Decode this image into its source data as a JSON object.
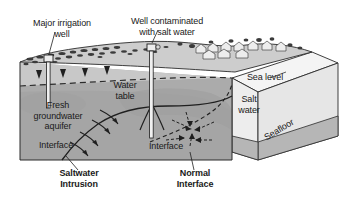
{
  "figure": {
    "type": "block-diagram",
    "background_color": "#ffffff"
  },
  "labels": {
    "major_irrigation_well": "Major irrigation\nwell",
    "well_contaminated": "Well contaminated\nwith salt water",
    "water_table": "Water\ntable",
    "fresh_groundwater_aquifer": "Fresh\ngroundwater\naquifer",
    "interface_left": "Interface",
    "interface_right": "Interface",
    "sea_level": "Sea level",
    "salt_water": "Salt\nwater",
    "seafloor": "Seafloor",
    "saltwater_intrusion": "Saltwater\nIntrusion",
    "normal_interface": "Normal\nInterface"
  },
  "colors": {
    "outline": "#2b2b2b",
    "aquifer_fill": "#a9a9a9",
    "unsaturated_fill": "#c6c6c6",
    "saturated_shadow": "#9a9a9a",
    "ocean_top_fill": "#f2f2f2",
    "ocean_front_fill": "#e2e2e2",
    "seafloor_band": "#b4b4b4",
    "terrain_top": "#cfcfcf",
    "vegetation": "#3d3d3d",
    "text": "#1a1a1a"
  }
}
